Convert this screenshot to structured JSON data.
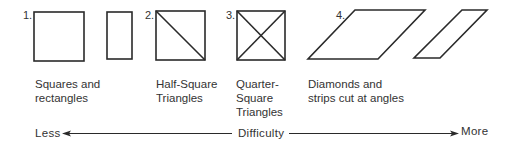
{
  "figure": {
    "groups": [
      {
        "number": "1.",
        "label_lines": [
          "Squares and",
          "rectangles"
        ]
      },
      {
        "number": "2.",
        "label_lines": [
          "Half-Square",
          "Triangles"
        ]
      },
      {
        "number": "3.",
        "label_lines": [
          "Quarter-",
          "Square",
          "Triangles"
        ]
      },
      {
        "number": "4.",
        "label_lines": [
          "Diamonds and",
          "strips cut at angles"
        ]
      }
    ],
    "axis": {
      "left_label": "Less",
      "center_label": "Difficulty",
      "right_label": "More"
    },
    "colors": {
      "stroke": "#2a2a2a",
      "background": "#ffffff"
    }
  }
}
